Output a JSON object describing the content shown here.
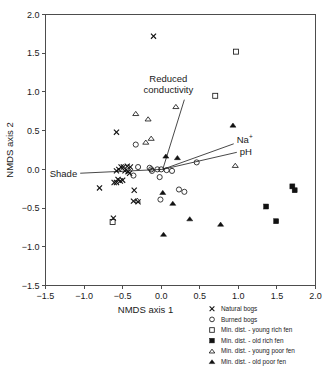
{
  "chart_data": {
    "type": "scatter",
    "title": "",
    "xlabel": "NMDS axis 1",
    "ylabel": "NMDS axis 2",
    "xlim": [
      -1.5,
      2.0
    ],
    "ylim": [
      -1.5,
      2.0
    ],
    "xticks": [
      "-1.5",
      "-1.0",
      "-0.5",
      "0.0",
      "0.5",
      "1.0",
      "1.5",
      "2.0"
    ],
    "yticks": [
      "2.0",
      "1.5",
      "1.0",
      "0.5",
      "0.0",
      "-0.5",
      "-1.0",
      "-1.5"
    ],
    "xtick_values": [
      -1.5,
      -1.0,
      -0.5,
      0.0,
      0.5,
      1.0,
      1.5,
      2.0
    ],
    "ytick_values": [
      2.0,
      1.5,
      1.0,
      0.5,
      0.0,
      -0.5,
      -1.0,
      -1.5
    ],
    "grid": false,
    "legend_position": "bottom-right",
    "series": [
      {
        "name": "Natural bogs",
        "marker": "x",
        "points": [
          [
            -0.1,
            1.72
          ],
          [
            -0.58,
            0.48
          ],
          [
            -0.4,
            0.03
          ],
          [
            -0.44,
            0.04
          ],
          [
            -0.49,
            0.03
          ],
          [
            -0.52,
            0.03
          ],
          [
            -0.55,
            0.0
          ],
          [
            -0.58,
            -0.02
          ],
          [
            -0.47,
            -0.02
          ],
          [
            -0.43,
            -0.03
          ],
          [
            -0.41,
            -0.05
          ],
          [
            -0.5,
            -0.14
          ],
          [
            -0.53,
            -0.15
          ],
          [
            -0.56,
            -0.13
          ],
          [
            -0.58,
            -0.17
          ],
          [
            -0.61,
            -0.17
          ],
          [
            -0.8,
            -0.24
          ],
          [
            -0.35,
            -0.27
          ],
          [
            -0.3,
            -0.42
          ],
          [
            -0.36,
            -0.41
          ],
          [
            -0.62,
            -0.63
          ]
        ]
      },
      {
        "name": "Burned bogs",
        "marker": "o",
        "points": [
          [
            -0.33,
            0.32
          ],
          [
            -0.3,
            0.03
          ],
          [
            -0.15,
            0.02
          ],
          [
            -0.13,
            0.0
          ],
          [
            -0.12,
            -0.02
          ],
          [
            -0.05,
            0.0
          ],
          [
            0.0,
            0.0
          ],
          [
            0.07,
            -0.01
          ],
          [
            0.14,
            -0.02
          ],
          [
            0.46,
            0.09
          ],
          [
            -0.36,
            -0.08
          ],
          [
            -0.02,
            -0.1
          ],
          [
            -0.01,
            -0.39
          ],
          [
            0.23,
            -0.26
          ],
          [
            0.3,
            -0.29
          ]
        ]
      },
      {
        "name": "Min. dist. - young rich fen",
        "marker": "square-open",
        "points": [
          [
            0.97,
            1.52
          ],
          [
            0.7,
            0.95
          ],
          [
            -0.63,
            -0.68
          ]
        ]
      },
      {
        "name": "Min. dist. - old rich fen",
        "marker": "square-filled",
        "points": [
          [
            1.7,
            -0.22
          ],
          [
            1.73,
            -0.27
          ],
          [
            1.36,
            -0.48
          ],
          [
            1.49,
            -0.67
          ]
        ]
      },
      {
        "name": "Min. dist. - young poor fen",
        "marker": "triangle-open",
        "points": [
          [
            -0.33,
            0.72
          ],
          [
            -0.17,
            0.65
          ],
          [
            -0.2,
            0.35
          ],
          [
            -0.13,
            0.4
          ],
          [
            0.19,
            0.81
          ],
          [
            0.96,
            0.05
          ],
          [
            -0.31,
            -0.4
          ]
        ]
      },
      {
        "name": "Min. dist. - old poor fen",
        "marker": "triangle-filled",
        "points": [
          [
            0.93,
            0.57
          ],
          [
            0.06,
            0.17
          ],
          [
            0.21,
            0.15
          ],
          [
            0.02,
            -0.3
          ],
          [
            0.15,
            -0.44
          ],
          [
            0.37,
            -0.64
          ],
          [
            0.77,
            -0.71
          ],
          [
            0.03,
            -0.84
          ]
        ]
      }
    ],
    "vectors": [
      {
        "name": "Shade",
        "label": "Shade",
        "from": [
          0.02,
          0.0
        ],
        "to": [
          -1.05,
          -0.05
        ]
      },
      {
        "name": "Reduced conductivity",
        "label": "Reduced conductivity",
        "from": [
          0.02,
          0.0
        ],
        "to": [
          0.3,
          0.9
        ]
      },
      {
        "name": "Na+",
        "label": "Na",
        "label_sup": "+",
        "from": [
          0.02,
          0.0
        ],
        "to": [
          0.94,
          0.33
        ]
      },
      {
        "name": "pH",
        "label": "pH",
        "from": [
          0.02,
          0.0
        ],
        "to": [
          0.98,
          0.22
        ]
      }
    ],
    "legend": [
      {
        "marker": "x",
        "label": "Natural bogs"
      },
      {
        "marker": "o",
        "label": "Burned bogs"
      },
      {
        "marker": "square-open",
        "label": "Min. dist. - young rich fen"
      },
      {
        "marker": "square-filled",
        "label": "Min. dist. - old rich fen"
      },
      {
        "marker": "triangle-open",
        "label": "Min. dist. - young poor fen"
      },
      {
        "marker": "triangle-filled",
        "label": "Min. dist. - old poor fen"
      }
    ],
    "colors": {
      "marker": "#111111",
      "axis": "#4d4d4d",
      "text": "#1a1a1a",
      "background": "#ffffff"
    }
  }
}
